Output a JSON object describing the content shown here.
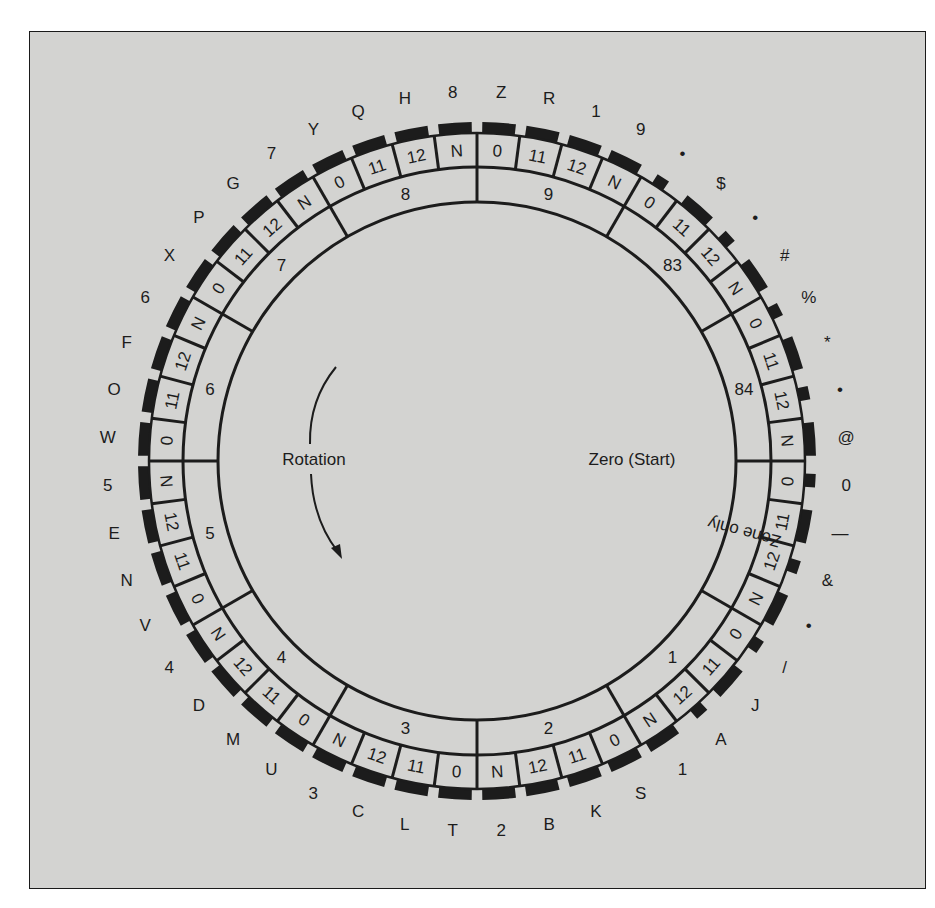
{
  "figure": {
    "colors": {
      "background": "#d3d3d1",
      "ink": "#1c1c1c",
      "page": "#ffffff"
    }
  },
  "diagram": {
    "center_labels": {
      "rotation": "Rotation",
      "zero_start": "Zero (Start)"
    },
    "cell_sequence_per_zone": [
      "0",
      "11",
      "12",
      "N"
    ],
    "zones": [
      {
        "label": "9"
      },
      {
        "label": "83"
      },
      {
        "label": "84"
      },
      {
        "label": "Zone only"
      },
      {
        "label": "1"
      },
      {
        "label": "2"
      },
      {
        "label": "3"
      },
      {
        "label": "4"
      },
      {
        "label": "5"
      },
      {
        "label": "6"
      },
      {
        "label": "7"
      },
      {
        "label": "8"
      }
    ],
    "outer_characters": [
      "Z",
      "R",
      "1",
      "9",
      "•",
      "$",
      "•",
      "#",
      "%",
      "*",
      "•",
      "@",
      "0",
      "—",
      "&",
      "•",
      "/",
      "J",
      "A",
      "1",
      "S",
      "K",
      "B",
      "2",
      "T",
      "L",
      "C",
      "3",
      "U",
      "M",
      "D",
      "4",
      "V",
      "N",
      "E",
      "5",
      "W",
      "O",
      "F",
      "6",
      "X",
      "P",
      "G",
      "7",
      "Y",
      "Q",
      "H",
      "8"
    ],
    "short_tab_cells": [
      4,
      6,
      8,
      10,
      12,
      14,
      16,
      18
    ]
  }
}
